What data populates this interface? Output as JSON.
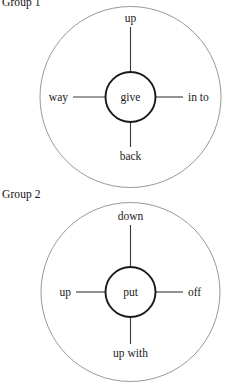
{
  "page": {
    "background_color": "#ffffff",
    "text_color": "#000000"
  },
  "diagram_data": {
    "type": "diagram",
    "style": "radial word-web / collocation spider diagrams",
    "group_count": 2
  },
  "groups": [
    {
      "label": "Group 1",
      "center_word": "give",
      "satellites": {
        "top": "up",
        "left": "way",
        "right": "in to",
        "bottom": "back"
      },
      "outer_circle_color": "#8d8d8d",
      "inner_circle_color": "#1a1a1a",
      "spoke_color": "#3a3a3a"
    },
    {
      "label": "Group 2",
      "center_word": "put",
      "satellites": {
        "top": "down",
        "left": "up",
        "right": "off",
        "bottom": "up with"
      },
      "outer_circle_color": "#8d8d8d",
      "inner_circle_color": "#1a1a1a",
      "spoke_color": "#3a3a3a"
    }
  ]
}
